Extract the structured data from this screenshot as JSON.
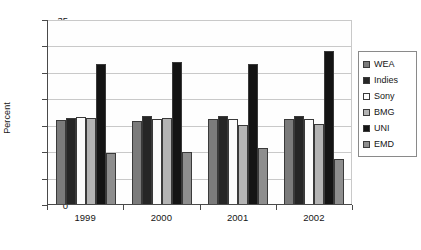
{
  "chart_data": {
    "type": "bar",
    "title": "",
    "subtitle": "",
    "xlabel": "",
    "ylabel": "Percent",
    "categories": [
      "1999",
      "2000",
      "2001",
      "2002"
    ],
    "ylim": [
      0,
      35
    ],
    "yticks": [
      0,
      5,
      10,
      15,
      20,
      25,
      30,
      35
    ],
    "grid": true,
    "legend_position": "right",
    "series": [
      {
        "name": "WEA",
        "color": "#7b7b7b",
        "values": [
          15.9,
          15.8,
          16.1,
          16.1
        ]
      },
      {
        "name": "Indies",
        "color": "#262626",
        "values": [
          16.2,
          16.7,
          16.7,
          16.6
        ]
      },
      {
        "name": "Sony",
        "color": "#fcfcfc",
        "values": [
          16.4,
          16.1,
          16.0,
          16.0
        ]
      },
      {
        "name": "BMG",
        "color": "#b4b4b4",
        "values": [
          16.2,
          16.3,
          14.9,
          15.1
        ]
      },
      {
        "name": "UNI",
        "color": "#141414",
        "values": [
          26.5,
          26.9,
          26.5,
          29.0
        ]
      },
      {
        "name": "EMD",
        "color": "#8e8e8e",
        "values": [
          9.6,
          9.8,
          10.6,
          8.5
        ]
      }
    ]
  }
}
